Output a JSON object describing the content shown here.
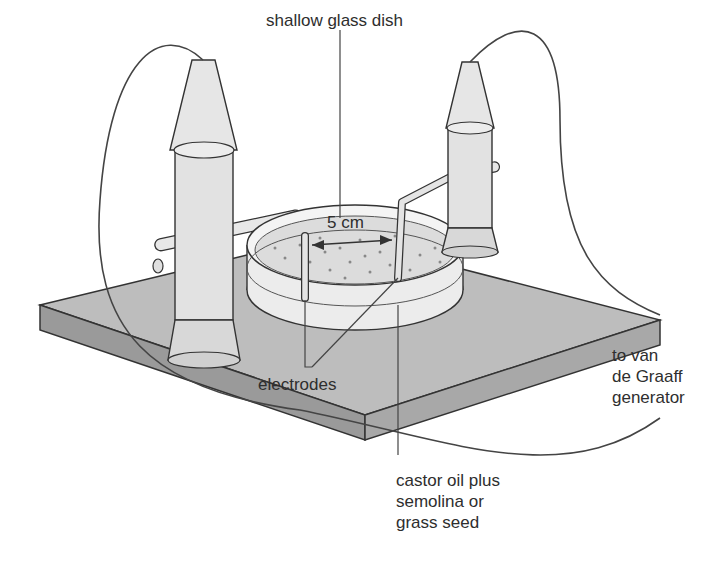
{
  "diagram": {
    "labels": {
      "dish": "shallow glass dish",
      "distance": "5 cm",
      "electrodes": "electrodes",
      "generator_line1": "to van",
      "generator_line2": "de Graaff",
      "generator_line3": "generator",
      "medium_line1": "castor oil plus",
      "medium_line2": "semolina or",
      "medium_line3": "grass seed"
    },
    "components": [
      "insulated base board",
      "left insulated electrode holder",
      "right insulated electrode holder",
      "shallow glass dish",
      "left electrode",
      "right electrode",
      "connecting wires"
    ],
    "colors": {
      "base_top": "#bdbdbd",
      "base_side": "#9a9a9a",
      "holder": "#e2e2e2",
      "outline": "#333333",
      "label_text": "#2e2e2e"
    }
  }
}
